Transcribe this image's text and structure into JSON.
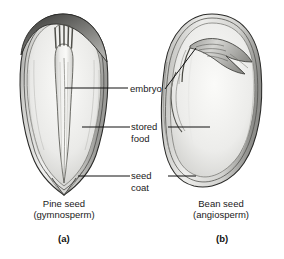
{
  "figure": {
    "background_color": "#ffffff",
    "ink_color": "#1a1a1a"
  },
  "labels": {
    "embryo": "embryo",
    "stored_food_line1": "stored",
    "stored_food_line2": "food",
    "seed_coat_line1": "seed",
    "seed_coat_line2": "coat"
  },
  "captions": {
    "left_line1": "Pine seed",
    "left_line2": "(gymnosperm)",
    "right_line1": "Bean seed",
    "right_line2": "(angiosperm)"
  },
  "panel_letters": {
    "left": "(a)",
    "right": "(b)"
  },
  "specimens": [
    {
      "name": "pine-seed",
      "common_name": "Pine seed",
      "group": "gymnosperm",
      "panel": "(a)",
      "parts": [
        "embryo",
        "stored food",
        "seed coat"
      ]
    },
    {
      "name": "bean-seed",
      "common_name": "Bean seed",
      "group": "angiosperm",
      "panel": "(b)",
      "parts": [
        "embryo",
        "stored food",
        "seed coat"
      ]
    }
  ]
}
